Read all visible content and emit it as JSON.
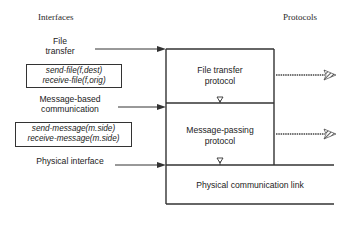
{
  "headings": {
    "interfaces": "Interfaces",
    "protocols": "Protocols"
  },
  "interfaces": [
    {
      "id": "file-transfer",
      "label_line1": "File",
      "label_line2": "transfer"
    },
    {
      "id": "message-based",
      "label_line1": "Message-based",
      "label_line2": "communication"
    },
    {
      "id": "physical",
      "label_line1": "Physical interface"
    }
  ],
  "code_boxes": {
    "file": {
      "line1": "send-file(f,dest)",
      "line2": "receive-file(f,orig)"
    },
    "message": {
      "line1": "send-message(m.side)",
      "line2": "receive-message(m.side)"
    }
  },
  "protocol_layers": [
    {
      "id": "file-transfer-protocol",
      "line1": "File transfer",
      "line2": "protocol"
    },
    {
      "id": "message-passing-protocol",
      "line1": "Message-passing",
      "line2": "protocol"
    },
    {
      "id": "physical-link",
      "line1": "Physical communication link"
    }
  ],
  "colors": {
    "line": "#333333",
    "text": "#222222",
    "background": "#ffffff"
  }
}
